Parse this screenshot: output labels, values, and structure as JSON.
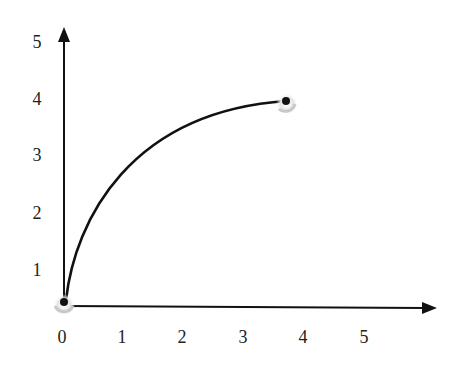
{
  "diagram": {
    "type": "curve-on-axes",
    "y_axis": {
      "tick_labels": [
        "1",
        "2",
        "3",
        "4",
        "5"
      ]
    },
    "x_axis": {
      "tick_labels": [
        "0",
        "1",
        "2",
        "3",
        "4",
        "5"
      ]
    },
    "curve": {
      "start_point": {
        "x": 0,
        "y": 0
      },
      "end_point": {
        "x": 3.7,
        "y": 3.9
      }
    },
    "colors": {
      "line": "#111111",
      "shadow": "#bdbdbd",
      "background": "#ffffff"
    }
  }
}
